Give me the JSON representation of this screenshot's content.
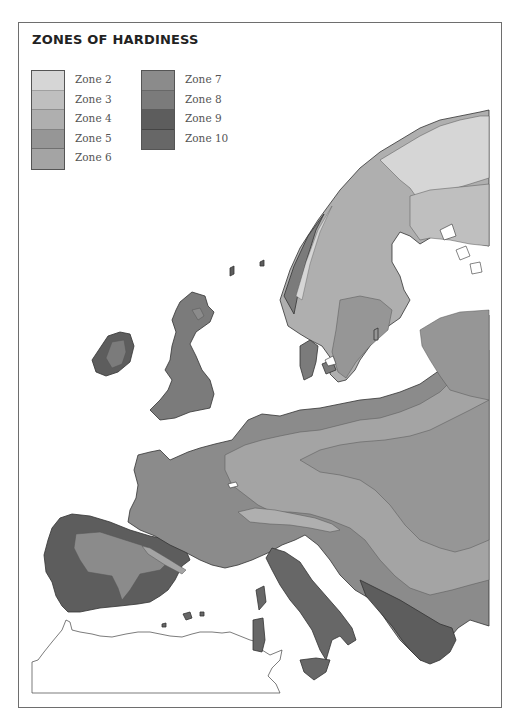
{
  "map": {
    "title": "ZONES OF HARDINESS",
    "legend": {
      "column_1": [
        {
          "zone": "Zone 2",
          "color": "#d6d6d6"
        },
        {
          "zone": "Zone 3",
          "color": "#bfbfbf"
        },
        {
          "zone": "Zone 4",
          "color": "#afafaf"
        },
        {
          "zone": "Zone 5",
          "color": "#969696"
        },
        {
          "zone": "Zone 6",
          "color": "#a4a4a4"
        }
      ],
      "column_2": [
        {
          "zone": "Zone 7",
          "color": "#8b8b8b"
        },
        {
          "zone": "Zone 8",
          "color": "#7b7b7b"
        },
        {
          "zone": "Zone 9",
          "color": "#5d5d5d"
        },
        {
          "zone": "Zone 10",
          "color": "#676767"
        }
      ]
    },
    "region": "Europe",
    "colors": {
      "outline": "#333333",
      "sea": "#ffffff",
      "africa_fill": "#ffffff"
    }
  }
}
